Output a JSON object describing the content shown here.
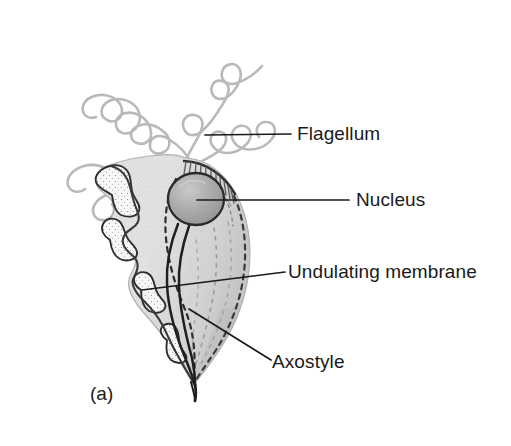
{
  "figure": {
    "caption": "(a)",
    "background_color": "#ffffff"
  },
  "labels": [
    {
      "id": "flagellum",
      "text": "Flagellum",
      "points_to": "anterior flagella",
      "leader_from": [
        205,
        135
      ],
      "leader_to": [
        290,
        135
      ]
    },
    {
      "id": "nucleus",
      "text": "Nucleus",
      "points_to": "nucleus",
      "leader_from": [
        200,
        200
      ],
      "leader_to": [
        348,
        200
      ]
    },
    {
      "id": "undulating-membrane",
      "text": "Undulating membrane",
      "points_to": "undulating membrane",
      "leader_from": [
        143,
        289
      ],
      "leader_to": [
        284,
        272
      ]
    },
    {
      "id": "axostyle",
      "text": "Axostyle",
      "points_to": "axostyle",
      "leader_from": [
        190,
        310
      ],
      "leader_to": [
        270,
        359
      ]
    }
  ],
  "colors": {
    "cytoplasm_light": "#e3e3e3",
    "cytoplasm_mid": "#d2d2d2",
    "cytoplasm_shadow": "#c4c4c4",
    "nucleus_fill": "#a9a9a9",
    "nucleus_highlight": "#c8c8c8",
    "outline_dark": "#2b2b2b",
    "outline_mid": "#555555",
    "flagellum_gray": "#b7b7b7",
    "membrane_patch": "#f6f6f6",
    "leader_line": "#1a1a1a",
    "text": "#1a1a1a"
  },
  "structures": {
    "flagella_count": 4,
    "nucleus_shape": "oval",
    "body_shape": "teardrop-leaf",
    "hatching_region": "anterior-right costa",
    "axostyle_description": "double dark line through cell exiting posterior tip"
  }
}
